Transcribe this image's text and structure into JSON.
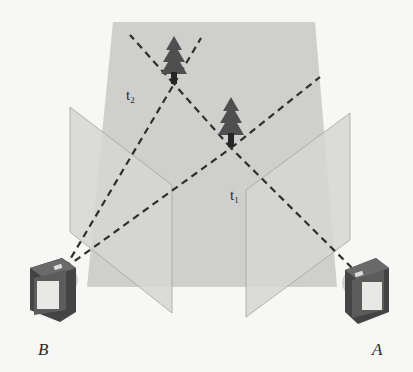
{
  "diagram": {
    "labels": {
      "time_far": "t",
      "time_far_sub": "2",
      "time_near": "t",
      "time_near_sub": "1",
      "camera_left": "B",
      "camera_right": "A"
    },
    "objects": [
      {
        "name": "tree-at-t2",
        "x": 174,
        "y": 78
      },
      {
        "name": "tree-at-t1",
        "x": 231,
        "y": 145
      }
    ],
    "cameras": [
      {
        "name": "B",
        "x": 55,
        "y": 290
      },
      {
        "name": "A",
        "x": 365,
        "y": 293
      }
    ],
    "colors": {
      "background": "#f7f7f5",
      "back_plane": "#cfcfcd",
      "image_plane": "#d3d3d1",
      "plane_edge": "#9a9a98",
      "ray": "#2e2e2e",
      "tree": "#4f4f4f",
      "trunk": "#262626",
      "camera_body": "#5a5a5a",
      "camera_screen": "#e8e8e6"
    }
  }
}
